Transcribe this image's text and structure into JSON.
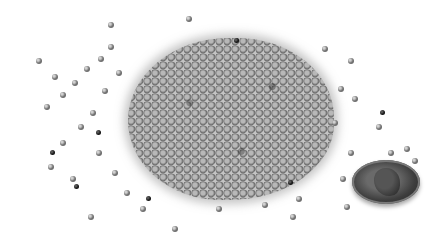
{
  "image": {
    "description": "Grayscale photo of a pile of small round seeds with scattered seeds and a penny for scale",
    "subject": "seed pile",
    "scale_reference": "penny",
    "colors": {
      "background": "#ffffff",
      "seed": "#8c8c8c",
      "dark_seed": "#222222",
      "penny": "#3e3e3e"
    }
  }
}
